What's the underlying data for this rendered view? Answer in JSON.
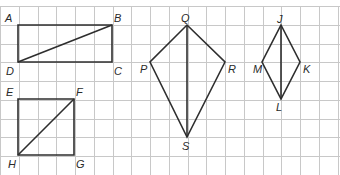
{
  "grid": {
    "origin_x": 0,
    "origin_y": 6,
    "spacing": 18.75,
    "cols": 19,
    "rows": 10,
    "line_color": "#c8c8c8"
  },
  "shapes": [
    {
      "name": "rectangle-ABCD",
      "type": "rectangle",
      "vertices": {
        "A": [
          18,
          25
        ],
        "B": [
          112,
          25
        ],
        "C": [
          112,
          62
        ],
        "D": [
          18,
          62
        ]
      },
      "diagonal": [
        "D",
        "B"
      ]
    },
    {
      "name": "square-EFGH",
      "type": "square",
      "vertices": {
        "E": [
          18,
          99
        ],
        "F": [
          74,
          99
        ],
        "G": [
          74,
          155
        ],
        "H": [
          18,
          155
        ]
      },
      "diagonal": [
        "H",
        "F"
      ]
    },
    {
      "name": "kite-PQRS",
      "type": "kite",
      "vertices": {
        "Q": [
          187,
          25
        ],
        "R": [
          225,
          62
        ],
        "S": [
          187,
          137
        ],
        "P": [
          150,
          62
        ]
      },
      "diagonal": [
        "Q",
        "S"
      ]
    },
    {
      "name": "rhombus-JKLM",
      "type": "rhombus",
      "vertices": {
        "J": [
          281,
          25
        ],
        "K": [
          300,
          62
        ],
        "L": [
          281,
          99
        ],
        "M": [
          262,
          62
        ]
      },
      "diagonal": [
        "J",
        "L"
      ]
    }
  ],
  "labels": {
    "A": "A",
    "B": "B",
    "C": "C",
    "D": "D",
    "E": "E",
    "F": "F",
    "G": "G",
    "H": "H",
    "P": "P",
    "Q": "Q",
    "R": "R",
    "S": "S",
    "J": "J",
    "K": "K",
    "L": "L",
    "M": "M"
  },
  "colors": {
    "shape_stroke": "#2e2e2e",
    "label": "#2a2a2a",
    "background": "#ffffff"
  }
}
